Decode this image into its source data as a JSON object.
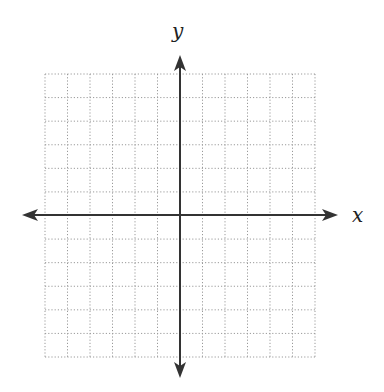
{
  "diagram": {
    "type": "coordinate-plane",
    "x_axis_label": "x",
    "y_axis_label": "y",
    "grid": {
      "columns": 12,
      "rows": 12,
      "left": 45,
      "right": 315,
      "top": 74,
      "bottom": 357,
      "line_style": "dotted",
      "line_color": "#9a9a9a"
    },
    "origin": {
      "x": 180,
      "y": 215
    },
    "x_axis": {
      "start": 22,
      "end": 338,
      "color": "#333333"
    },
    "y_axis": {
      "start": 55,
      "end": 378,
      "color": "#333333"
    }
  }
}
